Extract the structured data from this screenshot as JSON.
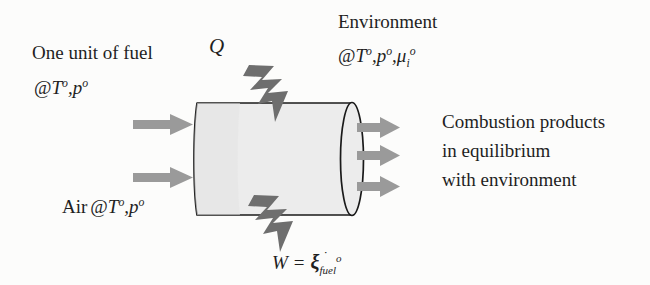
{
  "figure": {
    "background_color": "#fcfcfb"
  },
  "labels": {
    "fuel_line1": "One unit of fuel",
    "fuel_at": "@",
    "fuel_T": "T",
    "fuel_deg1": "o",
    "fuel_comma": ",",
    "fuel_p": "p",
    "fuel_deg2": "o",
    "heat_symbol": "Q",
    "environment_line1": "Environment",
    "env_at": "@",
    "env_T": "T",
    "env_deg1": "o",
    "env_comma1": ",",
    "env_p": "p",
    "env_deg2": "o",
    "env_comma2": ",",
    "env_mu": "μ",
    "env_mu_sub": "i",
    "env_mu_sup": "o",
    "air_prefix": "Air",
    "air_at": "@",
    "air_T": "T",
    "air_deg1": "o",
    "air_comma": ",",
    "air_p": "p",
    "air_deg2": "o",
    "products_line1": "Combustion products",
    "products_line2": "in equilibrium",
    "products_line3": "with environment",
    "work_W": "W",
    "work_equals": "=",
    "work_xi": "ξ",
    "work_xi_dot": "˙",
    "work_xi_sup": "o",
    "work_xi_sub": "fuel"
  },
  "icons": {
    "fuel_inlet_arrow": "arrow-right-icon",
    "air_inlet_arrow": "arrow-right-icon",
    "product_outlet_arrow": "arrow-right-icon",
    "heat_bolt": "lightning-bolt-icon",
    "work_bolt": "lightning-bolt-icon",
    "chamber": "cylinder-icon"
  },
  "colors": {
    "arrow_gray": "#939393",
    "bolt_gray": "#6e6e6e",
    "cylinder_fill": "#ececec",
    "cylinder_stroke": "#1a1a1a",
    "text": "#1f1f1f",
    "background": "#fcfcfb"
  },
  "geometry": {
    "cylinder_left_x": 197,
    "cylinder_right_x": 352,
    "cylinder_top_y": 102,
    "cylinder_bottom_y": 216,
    "endcap_rx": 11,
    "inlet_arrow_ys": [
      125,
      178
    ],
    "outlet_arrow_ys": [
      128,
      156,
      187
    ]
  }
}
